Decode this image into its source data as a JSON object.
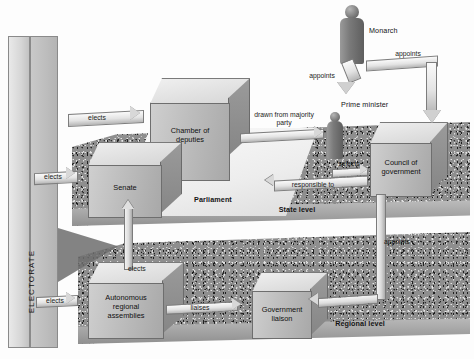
{
  "diagram": {
    "electorate_label": "ELECTORATE",
    "level_labels": {
      "state": "State level",
      "regional": "Regional level",
      "parliament": "Parliament"
    },
    "boxes": [
      {
        "id": "chamber-of-deputies",
        "label": "Chamber of\ndeputies"
      },
      {
        "id": "senate",
        "label": "Senate"
      },
      {
        "id": "council-of-government",
        "label": "Council of\ngovernment"
      },
      {
        "id": "autonomous-regional-assemblies",
        "label": "Autonomous\nregional\nassemblies"
      },
      {
        "id": "government-liaison",
        "label": "Government\nliaison"
      }
    ],
    "figures": [
      {
        "id": "monarch",
        "label": "Monarch"
      },
      {
        "id": "prime-minister",
        "label": "Prime minister"
      }
    ],
    "arrows": [
      {
        "id": "elects-chamber",
        "label": "elects"
      },
      {
        "id": "elects-senate",
        "label": "elects"
      },
      {
        "id": "elects-regional-assemblies",
        "label": "elects"
      },
      {
        "id": "elects-senate-from-assemblies",
        "label": "elects"
      },
      {
        "id": "monarch-appoints-pm",
        "label": "appoints"
      },
      {
        "id": "monarch-appoints-council",
        "label": "appoints"
      },
      {
        "id": "drawn-from-majority-party",
        "label": "drawn from majority\nparty"
      },
      {
        "id": "pm-selects-council",
        "label": "selects"
      },
      {
        "id": "responsible-to-parliament",
        "label": "responsible to"
      },
      {
        "id": "council-appoints-liaison",
        "label": "appoints"
      },
      {
        "id": "assemblies-liaises",
        "label": "liaises"
      }
    ],
    "colors": {
      "background": "#fdfdfd",
      "box_face": "#bdbdbd",
      "box_top": "#e4e4e4",
      "gravel": "#8e8e8e",
      "figure": "#7a7a7a",
      "text": "#141414"
    }
  }
}
